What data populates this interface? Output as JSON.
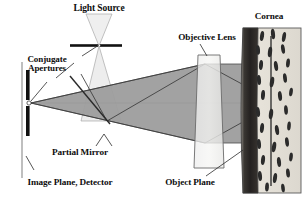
{
  "figure": {
    "type": "optical-ray-diagram"
  },
  "labels": {
    "light_source": "Light Source",
    "conjugate_apertures_line1": "Conjugate",
    "conjugate_apertures_line2": "Apertures",
    "partial_mirror": "Partial Mirror",
    "image_plane_detector": "Image Plane, Detector",
    "objective_lens": "Objective Lens",
    "object_plane": "Object Plane",
    "cornea": "Cornea"
  },
  "colors": {
    "ink": "#0d0d0d",
    "outline": "#3c3c3c",
    "beam_gray": "#9b9b9b",
    "beam_gray_light": "#b4b4b4",
    "source_cone": "#ececec",
    "lens_fill": "#f0f0f0",
    "cornea_light": "#e3e0d8",
    "cornea_dark": "#2e2e2e",
    "cell_fill": "#2b2b2b",
    "axis_line": "#8c8c8c",
    "background": "#ffffff"
  },
  "elements": {
    "optical_axis_y": 103,
    "aperture_x": 29,
    "mirror_label_x": 49,
    "lens_x": 205,
    "cornea_x": 243,
    "source_x": 99,
    "source_y": 46
  },
  "cornea_cells": [
    {
      "x": 262,
      "y": 36,
      "rx": 2.0,
      "ry": 5.0,
      "rot": 8
    },
    {
      "x": 273,
      "y": 34,
      "rx": 2.0,
      "ry": 5.2,
      "rot": -6
    },
    {
      "x": 284,
      "y": 37,
      "rx": 1.9,
      "ry": 5.0,
      "rot": 10
    },
    {
      "x": 258,
      "y": 50,
      "rx": 2.0,
      "ry": 4.8,
      "rot": -4
    },
    {
      "x": 270,
      "y": 52,
      "rx": 2.1,
      "ry": 5.2,
      "rot": 7
    },
    {
      "x": 283,
      "y": 49,
      "rx": 1.9,
      "ry": 4.8,
      "rot": -9
    },
    {
      "x": 261,
      "y": 65,
      "rx": 2.0,
      "ry": 5.0,
      "rot": 5
    },
    {
      "x": 276,
      "y": 66,
      "rx": 2.0,
      "ry": 5.0,
      "rot": -8
    },
    {
      "x": 288,
      "y": 63,
      "rx": 1.9,
      "ry": 4.6,
      "rot": 6
    },
    {
      "x": 259,
      "y": 80,
      "rx": 2.0,
      "ry": 5.0,
      "rot": -5
    },
    {
      "x": 272,
      "y": 82,
      "rx": 2.1,
      "ry": 5.4,
      "rot": 9
    },
    {
      "x": 285,
      "y": 78,
      "rx": 1.9,
      "ry": 4.8,
      "rot": -7
    },
    {
      "x": 263,
      "y": 95,
      "rx": 2.0,
      "ry": 5.0,
      "rot": 4
    },
    {
      "x": 280,
      "y": 96,
      "rx": 2.0,
      "ry": 4.9,
      "rot": -6
    },
    {
      "x": 291,
      "y": 92,
      "rx": 1.8,
      "ry": 4.4,
      "rot": 8
    },
    {
      "x": 258,
      "y": 112,
      "rx": 2.0,
      "ry": 5.0,
      "rot": -6
    },
    {
      "x": 271,
      "y": 114,
      "rx": 2.1,
      "ry": 5.2,
      "rot": 7
    },
    {
      "x": 286,
      "y": 110,
      "rx": 1.9,
      "ry": 4.8,
      "rot": -4
    },
    {
      "x": 262,
      "y": 128,
      "rx": 2.0,
      "ry": 5.0,
      "rot": 6
    },
    {
      "x": 277,
      "y": 130,
      "rx": 2.0,
      "ry": 5.1,
      "rot": -8
    },
    {
      "x": 289,
      "y": 126,
      "rx": 1.8,
      "ry": 4.5,
      "rot": 5
    },
    {
      "x": 259,
      "y": 144,
      "rx": 2.0,
      "ry": 4.9,
      "rot": -5
    },
    {
      "x": 274,
      "y": 147,
      "rx": 2.1,
      "ry": 5.3,
      "rot": 9
    },
    {
      "x": 287,
      "y": 142,
      "rx": 1.9,
      "ry": 4.7,
      "rot": -7
    },
    {
      "x": 263,
      "y": 160,
      "rx": 2.0,
      "ry": 5.0,
      "rot": 6
    },
    {
      "x": 279,
      "y": 162,
      "rx": 2.0,
      "ry": 5.0,
      "rot": -6
    },
    {
      "x": 291,
      "y": 157,
      "rx": 1.8,
      "ry": 4.4,
      "rot": 7
    },
    {
      "x": 260,
      "y": 176,
      "rx": 2.0,
      "ry": 5.0,
      "rot": -5
    },
    {
      "x": 275,
      "y": 178,
      "rx": 2.0,
      "ry": 5.1,
      "rot": 8
    },
    {
      "x": 288,
      "y": 173,
      "rx": 1.9,
      "ry": 4.6,
      "rot": -6
    },
    {
      "x": 267,
      "y": 187,
      "rx": 1.9,
      "ry": 4.5,
      "rot": 4
    },
    {
      "x": 283,
      "y": 188,
      "rx": 1.8,
      "ry": 4.3,
      "rot": -7
    }
  ]
}
